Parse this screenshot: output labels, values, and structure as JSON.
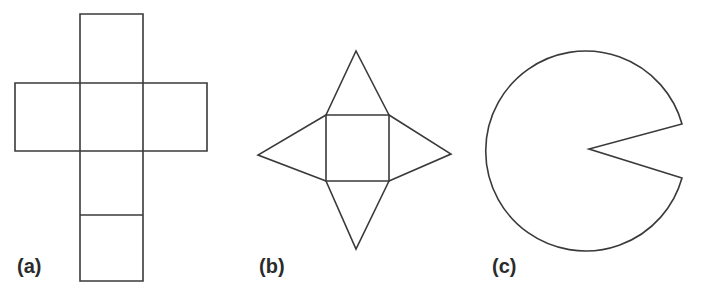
{
  "figure": {
    "background_color": "#ffffff",
    "stroke_color": "#3a3a3a",
    "stroke_width": 1.6,
    "label_color": "#2b2b2b",
    "canvas": {
      "width": 709,
      "height": 295
    },
    "panels": [
      {
        "id": "a",
        "label": "(a)",
        "label_position": {
          "x": 17,
          "y": 256
        },
        "shape_name": "cube-net-cross",
        "description": "Net of a cube drawn as a cross of six squares: one vertical column of four squares with two squares flanking the second square from the top.",
        "geometry": {
          "vertical_strip": {
            "x_left": 80,
            "x_right": 143,
            "y_top": 14,
            "y_bottom": 281
          },
          "horizontal_strip": {
            "x_left": 15,
            "x_right": 207,
            "y_top": 83,
            "y_bottom": 151
          },
          "internal_divider_y": 215,
          "cell_size": 63
        }
      },
      {
        "id": "b",
        "label": "(b)",
        "label_position": {
          "x": 259,
          "y": 256
        },
        "shape_name": "square-pyramid-net",
        "description": "Net of a square pyramid: a central square with one isosceles triangle folded out from each of its four edges.",
        "geometry": {
          "square": {
            "x_left": 326,
            "x_right": 389,
            "y_top": 115,
            "y_bottom": 181
          },
          "apex_top": {
            "x": 356,
            "y": 51
          },
          "apex_bottom": {
            "x": 356,
            "y": 249
          },
          "apex_left": {
            "x": 258,
            "y": 155
          },
          "apex_right": {
            "x": 451,
            "y": 154
          }
        }
      },
      {
        "id": "c",
        "label": "(c)",
        "label_position": {
          "x": 492,
          "y": 256
        },
        "shape_name": "circle-sector-removed",
        "description": "A circle with a pie-shaped wedge cut out of its right side, the wedge vertex sitting at the circle centre.",
        "geometry": {
          "center": {
            "x": 592,
            "y": 148
          },
          "radius": 100,
          "wedge_vertex": {
            "x": 589,
            "y": 149
          },
          "wedge_edge_upper": {
            "x": 682,
            "y": 124
          },
          "wedge_edge_lower": {
            "x": 682,
            "y": 178
          },
          "wedge_angle_degrees": 31
        }
      }
    ]
  }
}
